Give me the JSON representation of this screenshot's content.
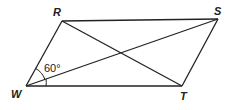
{
  "diagram": {
    "type": "parallelogram",
    "vertices": {
      "R": {
        "label": "R",
        "x": 62,
        "y": 21
      },
      "S": {
        "label": "S",
        "x": 218,
        "y": 19
      },
      "T": {
        "label": "T",
        "x": 182,
        "y": 86
      },
      "W": {
        "label": "W",
        "x": 26,
        "y": 86
      }
    },
    "sides": [
      "RS",
      "ST",
      "TW",
      "WR"
    ],
    "diagonals": [
      "RT",
      "WS"
    ],
    "angle_mark": {
      "vertex": "W",
      "between": [
        "WR",
        "WS"
      ],
      "label": "60°"
    },
    "stroke_color": "#222222"
  }
}
